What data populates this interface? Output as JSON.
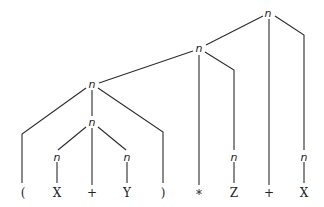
{
  "diagram": {
    "type": "parse-tree",
    "node_label": "n",
    "leaves": [
      "(",
      "X",
      "+",
      "Y",
      ")",
      "*",
      "Z",
      "+",
      "X"
    ],
    "nodes": [
      {
        "id": "root",
        "label": "n"
      },
      {
        "id": "n2",
        "label": "n"
      },
      {
        "id": "n3",
        "label": "n"
      },
      {
        "id": "n4",
        "label": "n"
      },
      {
        "id": "nX",
        "label": "n"
      },
      {
        "id": "nY",
        "label": "n"
      },
      {
        "id": "nZ",
        "label": "n"
      },
      {
        "id": "nX2",
        "label": "n"
      }
    ]
  }
}
